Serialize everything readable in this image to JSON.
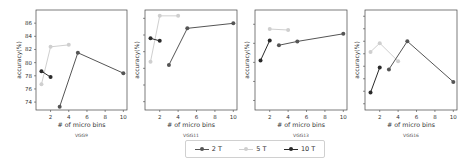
{
  "chart_data": [
    {
      "type": "line",
      "title": "VGG9",
      "xlabel": "# of micro bins",
      "ylabel": "accuracy(%)",
      "xlim": [
        0.4,
        10.4
      ],
      "ylim": [
        72.8,
        88.0
      ],
      "xticks": [
        2,
        4,
        6,
        8,
        10
      ],
      "yticks": [
        74,
        76,
        78,
        80,
        82,
        84,
        86
      ],
      "show_ytick_labels": true,
      "series": [
        {
          "name": "2 T",
          "x": [
            3,
            5,
            10
          ],
          "y": [
            73.3,
            81.5,
            78.4
          ]
        },
        {
          "name": "5 T",
          "x": [
            1,
            2,
            4
          ],
          "y": [
            76.7,
            82.4,
            82.7
          ]
        },
        {
          "name": "10 T",
          "x": [
            1,
            2
          ],
          "y": [
            78.7,
            77.8
          ]
        }
      ]
    },
    {
      "type": "line",
      "title": "VGG11",
      "xlabel": "# of micro bins",
      "ylabel": "accuracy(%)",
      "xlim": [
        0.4,
        10.4
      ],
      "ylim": [
        76.0,
        88.0
      ],
      "xticks": [
        2,
        4,
        6,
        8,
        10
      ],
      "yticks": [
        77,
        79,
        81,
        83,
        85,
        87
      ],
      "show_ytick_labels": false,
      "series": [
        {
          "name": "2 T",
          "x": [
            3,
            5,
            10
          ],
          "y": [
            81.4,
            85.8,
            86.4
          ]
        },
        {
          "name": "5 T",
          "x": [
            1,
            2,
            4
          ],
          "y": [
            81.8,
            87.3,
            87.3
          ]
        },
        {
          "name": "10 T",
          "x": [
            1,
            2
          ],
          "y": [
            84.6,
            84.3
          ]
        }
      ]
    },
    {
      "type": "line",
      "title": "VGG13",
      "xlabel": "# of micro bins",
      "ylabel": "accuracy(%)",
      "xlim": [
        0.4,
        10.4
      ],
      "ylim": [
        77.0,
        87.5
      ],
      "xticks": [
        2,
        4,
        6,
        8,
        10
      ],
      "yticks": [
        78,
        80,
        82,
        84,
        86
      ],
      "show_ytick_labels": false,
      "series": [
        {
          "name": "2 T",
          "x": [
            3,
            5,
            10
          ],
          "y": [
            83.8,
            84.2,
            85.0
          ]
        },
        {
          "name": "5 T",
          "x": [
            2,
            4
          ],
          "y": [
            85.5,
            85.4
          ]
        },
        {
          "name": "10 T",
          "x": [
            1,
            2
          ],
          "y": [
            82.2,
            84.3
          ]
        }
      ]
    },
    {
      "type": "line",
      "title": "VGG16",
      "xlabel": "# of micro bins",
      "ylabel": "accuracy(%)",
      "xlim": [
        0.4,
        10.4
      ],
      "ylim": [
        72.0,
        88.0
      ],
      "xticks": [
        2,
        4,
        6,
        8,
        10
      ],
      "yticks": [
        73,
        75,
        77,
        79,
        81,
        83,
        85,
        87
      ],
      "show_ytick_labels": false,
      "series": [
        {
          "name": "2 T",
          "x": [
            3,
            5,
            10
          ],
          "y": [
            78.5,
            83.0,
            76.5
          ]
        },
        {
          "name": "5 T",
          "x": [
            1,
            2,
            4
          ],
          "y": [
            81.3,
            82.7,
            79.8
          ]
        },
        {
          "name": "10 T",
          "x": [
            1,
            2
          ],
          "y": [
            74.8,
            78.8
          ]
        }
      ]
    }
  ],
  "legend": {
    "position": "bottom-center",
    "entries": [
      {
        "label": "2 T",
        "color": "#555555"
      },
      {
        "label": "5 T",
        "color": "#cfcfcf"
      },
      {
        "label": "10 T",
        "color": "#2a2a2a"
      }
    ]
  },
  "colors": {
    "2 T": "#555555",
    "5 T": "#cfcfcf",
    "10 T": "#2a2a2a",
    "axis": "#444444",
    "text": "#333333"
  }
}
